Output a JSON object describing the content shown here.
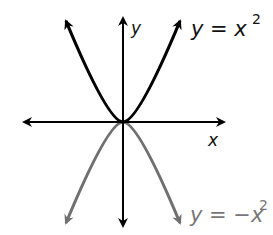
{
  "diagram": {
    "axes": {
      "x_label": "x",
      "y_label": "y",
      "origin_px": [
        123,
        122
      ]
    },
    "curves": [
      {
        "name": "upper-parabola",
        "equation_lhs": "y = x",
        "exponent": "2",
        "color": "#000000",
        "opens": "up"
      },
      {
        "name": "lower-parabola",
        "equation_lhs": "y = −x",
        "exponent": "2",
        "color": "#707070",
        "opens": "down"
      }
    ]
  }
}
